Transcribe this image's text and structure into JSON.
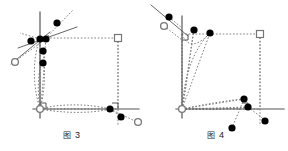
{
  "sheet": {
    "title": "Geometry figures 3 and 4",
    "background_color": "#ffffff"
  },
  "style": {
    "axis_color": "#555555",
    "dotted_color": "#808080",
    "dot_fill": "#000000",
    "open_marker_stroke": "#777777",
    "open_marker_fill": "#ffffff",
    "square_marker_stroke": "#777777",
    "caption_color": "#1a1a1a"
  },
  "panels": [
    {
      "id": "figure-3",
      "caption": {
        "mark": "图",
        "number": "3"
      },
      "axes": {
        "origin": [
          40,
          109
        ],
        "vertical": {
          "x": 40,
          "y_top": 12,
          "y_bottom": 118
        },
        "horizontal": {
          "y": 109,
          "x_left": 33,
          "x_right": 139
        }
      },
      "rect": {
        "x": 40,
        "y": 38,
        "width": 78,
        "height": 71
      },
      "square_marker": {
        "x": 118,
        "y": 38
      },
      "origin_marker": {
        "x": 40,
        "y": 109
      },
      "solid_segments": [
        {
          "from": [
            18,
            48
          ],
          "to": [
            75,
            28
          ]
        },
        {
          "from": [
            10,
            63
          ],
          "to": [
            48,
            33
          ]
        }
      ],
      "right_angle_marks": [
        {
          "x": 40,
          "y": 109,
          "dir": "up-right"
        },
        {
          "x": 118,
          "y": 109,
          "dir": "up-right"
        }
      ],
      "dots": [
        {
          "x": 31,
          "y": 41
        },
        {
          "x": 40,
          "y": 39
        },
        {
          "x": 46,
          "y": 39
        },
        {
          "x": 43,
          "y": 51
        },
        {
          "x": 43,
          "y": 63
        },
        {
          "x": 57,
          "y": 23
        },
        {
          "x": 110,
          "y": 109
        },
        {
          "x": 121,
          "y": 117
        }
      ],
      "open_circles": [
        {
          "x": 15,
          "y": 62
        },
        {
          "x": 138,
          "y": 122
        }
      ]
    },
    {
      "id": "figure-4",
      "caption": {
        "mark": "图",
        "number": "4"
      },
      "axes": {
        "origin": [
          38,
          109
        ],
        "vertical": {
          "x": 38,
          "y_top": 16,
          "y_bottom": 118
        },
        "horizontal": {
          "y": 109,
          "x_left": 32,
          "x_right": 140
        }
      },
      "rect": {
        "x": 38,
        "y": 34,
        "width": 78,
        "height": 75
      },
      "square_marker": {
        "x": 116,
        "y": 34
      },
      "origin_marker": {
        "x": 38,
        "y": 109
      },
      "solid_segments": [
        {
          "from": [
            8,
            6
          ],
          "to": [
            42,
            34
          ]
        }
      ],
      "right_angle_marks": [
        {
          "x": 38,
          "y": 34,
          "dir": "down-right"
        },
        {
          "x": 104,
          "y": 109,
          "dir": "up-right"
        }
      ],
      "dots": [
        {
          "x": 25,
          "y": 17
        },
        {
          "x": 50,
          "y": 30
        },
        {
          "x": 66,
          "y": 33
        },
        {
          "x": 100,
          "y": 99
        },
        {
          "x": 104,
          "y": 107
        },
        {
          "x": 88,
          "y": 128
        },
        {
          "x": 121,
          "y": 121
        }
      ],
      "open_circles": [
        {
          "x": 20,
          "y": 26
        }
      ]
    }
  ]
}
